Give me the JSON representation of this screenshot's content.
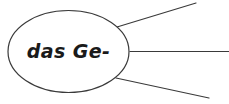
{
  "diagram": {
    "type": "mind-map-node",
    "background_color": "#ffffff",
    "stroke_color": "#3a3a3a",
    "text_color": "#1a1a1a",
    "node": {
      "shape": "ellipse",
      "label": "das Ge-",
      "center_x": 68.5,
      "center_y": 51.5,
      "radius_x": 60.5,
      "radius_y": 41,
      "stroke_width": 1.2,
      "fill": "#ffffff"
    },
    "branches": [
      {
        "name": "branch-upper",
        "x1": 117,
        "y1": 27,
        "x2": 196,
        "y2": 3,
        "stroke_width": 1.2
      },
      {
        "name": "branch-middle",
        "x1": 130,
        "y1": 51.5,
        "x2": 229,
        "y2": 51.5,
        "stroke_width": 1.2
      },
      {
        "name": "branch-lower",
        "x1": 116,
        "y1": 78,
        "x2": 209,
        "y2": 98,
        "stroke_width": 1.2
      }
    ]
  }
}
